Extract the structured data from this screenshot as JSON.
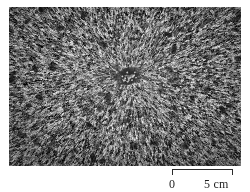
{
  "figure": {
    "name": "specimen-photograph-with-scale-bar",
    "photo": {
      "alt_text": "Grayscale photomicrograph of a radiating fibrous texture with a dark central nucleus",
      "subject": "radial fibrous aggregate",
      "center_feature": "dark central nucleus",
      "tone": "grayscale"
    },
    "scale_bar": {
      "start_label": "0",
      "end_label": "5 cm",
      "unit": "cm",
      "start_value": 0,
      "end_value": 5,
      "bar_length_px": 61,
      "tick_direction": "down"
    }
  },
  "colors": {
    "page_background": "#ffffff",
    "ink": "#1e1e1e",
    "rule": "#2b2b2b",
    "photo_mid_gray": "#8a8a8a"
  }
}
